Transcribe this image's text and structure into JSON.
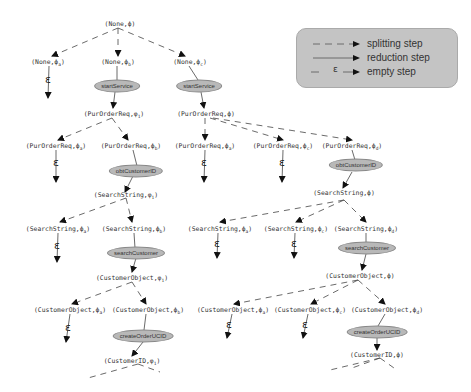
{
  "legend": {
    "splitting": "splitting step",
    "reduction": "reduction step",
    "empty": "empty step",
    "epsilon": "ε"
  },
  "nodes": {
    "root": "(None,ϕ)",
    "none_a": "(None,ϕ",
    "none_a_sub": "a",
    "none_b": "(None,ϕ",
    "none_b_sub": "b",
    "none_c": "(None,ϕ",
    "none_c_sub": "c",
    "por1": "(PurOrderReq,φ",
    "por1_sub": "1",
    "por2": "(PurOrderReq,ϕ)",
    "por_a1": "(PurOrderReq,ϕ",
    "por_a1_sub": "a",
    "por_b1": "(PurOrderReq,ϕ",
    "por_b1_sub": "b",
    "por_a2": "(PurOrderReq,ϕ",
    "por_a2_sub": "a",
    "por_c2": "(PurOrderReq,ϕ",
    "por_c2_sub": "c",
    "por_d2": "(PurOrderReq,ϕ",
    "por_d2_sub": "d",
    "ss1": "(SearchString,φ",
    "ss1_sub": "1",
    "ss2": "(SearchString,ϕ)",
    "ss_a1": "(SearchString,ϕ",
    "ss_a1_sub": "a",
    "ss_b1": "(SearchString,ϕ",
    "ss_b1_sub": "b",
    "ss_a2": "(SearchString,ϕ",
    "ss_a2_sub": "a",
    "ss_c2": "(SearchString,ϕ",
    "ss_c2_sub": "c",
    "ss_d2": "(SearchString,ϕ",
    "ss_d2_sub": "d",
    "co1": "(CustomerObject,φ",
    "co1_sub": "1",
    "co2": "(CustomerObject,ϕ)",
    "co_a1": "(CustomerObject,ϕ",
    "co_a1_sub": "a",
    "co_b1": "(CustomerObject,ϕ",
    "co_b1_sub": "b",
    "co_a2": "(CustomerObject,ϕ",
    "co_a2_sub": "a",
    "co_c2": "(CustomerObject,ϕ",
    "co_c2_sub": "c",
    "co_d2": "(CustomerObject,ϕ",
    "co_d2_sub": "d",
    "cid1": "(CustomerID,φ",
    "cid1_sub": "1",
    "cid2": "(CustomerID,ϕ)"
  },
  "operations": {
    "start1": "startService",
    "start2": "startService",
    "obt1": "obtCustomerID",
    "obt2": "obtCustomerID",
    "search1": "searchCustomer",
    "search2": "searchCustomer",
    "create1": "createOrderUCID",
    "create2": "createOrderUCID"
  },
  "epsilon": "ε"
}
